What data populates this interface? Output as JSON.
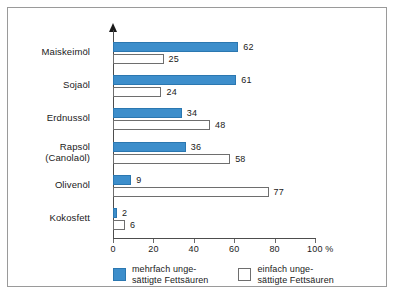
{
  "chart_data": {
    "type": "bar",
    "orientation": "horizontal",
    "title": "",
    "xlabel": "%",
    "ylabel": "",
    "xlim": [
      0,
      100
    ],
    "grid": false,
    "legend_position": "bottom",
    "categories": [
      "Maiskeimöl",
      "Sojaöl",
      "Erdnussöl",
      "Rapsöl\n(Canolaöl)",
      "Olivenöl",
      "Kokosfett"
    ],
    "tick_labels": [
      "0",
      "20",
      "40",
      "60",
      "80",
      "100 %"
    ],
    "tick_values": [
      0,
      20,
      40,
      60,
      80,
      100
    ],
    "series": [
      {
        "name": "mehrfach unge-\nsättigte Fettsäuren",
        "color": "#3d8ecb",
        "values": [
          62,
          61,
          34,
          36,
          9,
          2
        ]
      },
      {
        "name": "einfach unge-\nsättigte Fettsäuren",
        "color": "#ffffff",
        "values": [
          25,
          24,
          48,
          58,
          77,
          6
        ]
      }
    ]
  },
  "rows": [
    {
      "label": "Maiskeimöl",
      "label2": "",
      "poly": 62,
      "mono": 25
    },
    {
      "label": "Sojaöl",
      "label2": "",
      "poly": 61,
      "mono": 24
    },
    {
      "label": "Erdnussöl",
      "label2": "",
      "poly": 34,
      "mono": 48
    },
    {
      "label": "Rapsöl",
      "label2": "(Canolaöl)",
      "poly": 36,
      "mono": 58
    },
    {
      "label": "Olivenöl",
      "label2": "",
      "poly": 9,
      "mono": 77
    },
    {
      "label": "Kokosfett",
      "label2": "",
      "poly": 2,
      "mono": 6
    }
  ],
  "axis": {
    "ticks": [
      {
        "label": "0",
        "value": 0
      },
      {
        "label": "20",
        "value": 20
      },
      {
        "label": "40",
        "value": 40
      },
      {
        "label": "60",
        "value": 60
      },
      {
        "label": "80",
        "value": 80
      },
      {
        "label": "100 %",
        "value": 100
      }
    ]
  },
  "legend": {
    "items": [
      {
        "swatch": "poly",
        "line1": "mehrfach unge-",
        "line2": "sättigte Fettsäuren"
      },
      {
        "swatch": "mono",
        "line1": "einfach unge-",
        "line2": "sättigte Fettsäuren"
      }
    ]
  },
  "colors": {
    "bar_poly": "#3d8ecb",
    "bar_poly_border": "#2b77b0",
    "bar_mono": "#ffffff",
    "bar_mono_border": "#6e6e6e",
    "axis": "#4d4d4d",
    "frame": "#9a9a9a",
    "text": "#1a1a1a"
  }
}
